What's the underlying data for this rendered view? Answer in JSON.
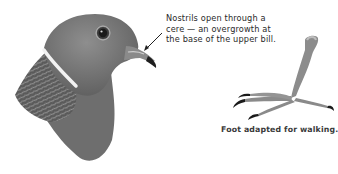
{
  "figure": {
    "head_illustration": "pigeon-head",
    "foot_illustration": "pigeon-foot",
    "nostril_note": "Nostrils open through a cere — an overgrowth at the base of the upper bill.",
    "nostril_note_lines": [
      "Nostrils open through a",
      "cere — an overgrowth at",
      "the base of the upper bill."
    ],
    "foot_caption": "Foot adapted for walking."
  },
  "colors": {
    "head_gray": "#7d7d7d",
    "neck_band": "#f2f2f2",
    "background": "#ffffff"
  }
}
